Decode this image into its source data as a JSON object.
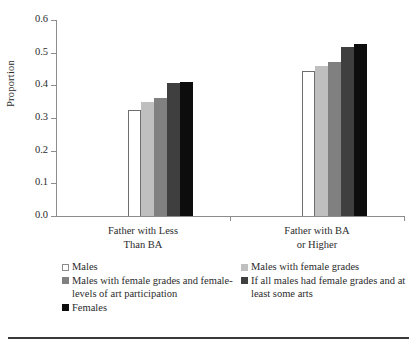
{
  "chart_data": {
    "type": "bar",
    "title": "",
    "xlabel": "",
    "ylabel": "Proportion",
    "ylim": [
      0.0,
      0.6
    ],
    "ytick_labels": [
      "0.0",
      "0.1",
      "0.2",
      "0.3",
      "0.4",
      "0.5",
      "0.6"
    ],
    "ytick_values": [
      0.0,
      0.1,
      0.2,
      0.3,
      0.4,
      0.5,
      0.6
    ],
    "grid": false,
    "legend_position": "below-axis-two-columns",
    "categories": [
      "Father with Less Than BA",
      "Father with BA or Higher"
    ],
    "category_label_lines": [
      [
        "Father with Less",
        "Than BA"
      ],
      [
        "Father with BA",
        "or Higher"
      ]
    ],
    "series": [
      {
        "name": "Males",
        "color": "#ffffff",
        "edge": "#6e6e6e",
        "values": [
          0.325,
          0.443
        ]
      },
      {
        "name": "Males with female grades",
        "color": "#bfbfbf",
        "edge": "#bfbfbf",
        "values": [
          0.348,
          0.458
        ]
      },
      {
        "name": "Males with female grades and female-levels of art participation",
        "color": "#808080",
        "edge": "#808080",
        "values": [
          0.36,
          0.473
        ]
      },
      {
        "name": "If all males had female grades and at least some arts",
        "color": "#3f3f3f",
        "edge": "#3f3f3f",
        "values": [
          0.408,
          0.518
        ]
      },
      {
        "name": "Females",
        "color": "#0d0d0d",
        "edge": "#0d0d0d",
        "values": [
          0.411,
          0.528
        ]
      }
    ]
  },
  "legend": {
    "left_column": [
      {
        "swatch": "#ffffff",
        "border": "#8c8c8c",
        "label": "Males"
      },
      {
        "swatch": "#808080",
        "border": "#808080",
        "label": "Males with female grades and female-levels of art participation"
      },
      {
        "swatch": "#0d0d0d",
        "border": "#0d0d0d",
        "label": "Females"
      }
    ],
    "right_column": [
      {
        "swatch": "#bfbfbf",
        "border": "#bfbfbf",
        "label": "Males with female grades"
      },
      {
        "swatch": "#3f3f3f",
        "border": "#3f3f3f",
        "label": "If all males had female grades and at least some arts"
      }
    ]
  },
  "colors": {
    "axis": "#8c8c8c",
    "text": "#2b2b2b",
    "rule": "#3a3a3a",
    "background": "#ffffff"
  }
}
